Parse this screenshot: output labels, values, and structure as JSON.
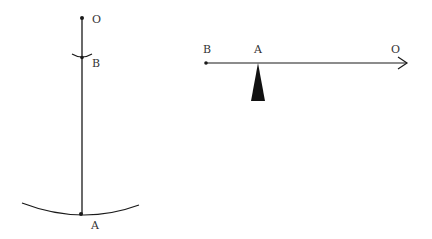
{
  "figures": {
    "pendulum": {
      "labels": {
        "top": "O",
        "middle": "B",
        "bottom": "A"
      }
    },
    "lever": {
      "labels": {
        "left": "B",
        "fulcrum": "A",
        "right": "O"
      }
    }
  },
  "colors": {
    "stroke": "#1a1a1a",
    "text": "#333333",
    "background": "#ffffff"
  }
}
